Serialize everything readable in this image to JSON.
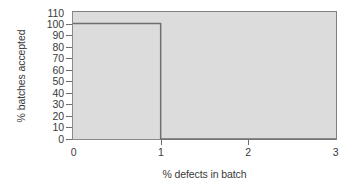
{
  "chart_data": {
    "type": "line",
    "title": "",
    "subtitle": "",
    "xlabel": "% defects in batch",
    "ylabel": "% batches accepted",
    "xlim": [
      0,
      3
    ],
    "ylim": [
      0,
      110
    ],
    "xticks": [
      "0",
      "1",
      "2",
      "3"
    ],
    "xtick_values": [
      0,
      1,
      2,
      3
    ],
    "yticks": [
      "0",
      "10",
      "20",
      "30",
      "40",
      "50",
      "60",
      "70",
      "80",
      "90",
      "100",
      "110"
    ],
    "ytick_values": [
      0,
      10,
      20,
      30,
      40,
      50,
      60,
      70,
      80,
      90,
      100,
      110
    ],
    "grid": false,
    "legend": null,
    "legend_position": "none",
    "series": [
      {
        "name": "ideal OC curve",
        "drawstyle": "steps-post",
        "x": [
          0,
          1,
          1,
          3
        ],
        "y": [
          100,
          100,
          0,
          0
        ],
        "values": [
          100,
          100,
          0,
          0
        ],
        "color": "#6e6e6e",
        "linewidth": 1.5
      }
    ],
    "annotations": [],
    "plot_background": "#dcdcdc",
    "axis_color": "#808080",
    "text_color": "#3a3a3a"
  }
}
